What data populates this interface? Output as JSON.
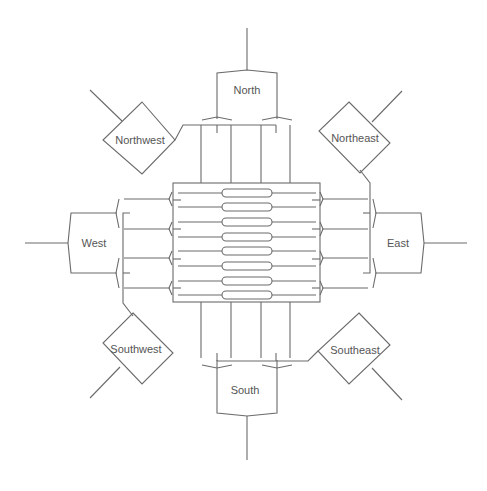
{
  "diagram": {
    "type": "switch-network-topology",
    "core": {
      "label": "",
      "slot_count": 8
    },
    "nodes": {
      "north": {
        "label": "North"
      },
      "south": {
        "label": "South"
      },
      "east": {
        "label": "East"
      },
      "west": {
        "label": "West"
      },
      "northwest": {
        "label": "Northwest"
      },
      "northeast": {
        "label": "Northeast"
      },
      "southwest": {
        "label": "Southwest"
      },
      "southeast": {
        "label": "Southeast"
      }
    },
    "colors": {
      "line": "#6b6b6b",
      "text": "#555555",
      "background": "#ffffff"
    }
  }
}
